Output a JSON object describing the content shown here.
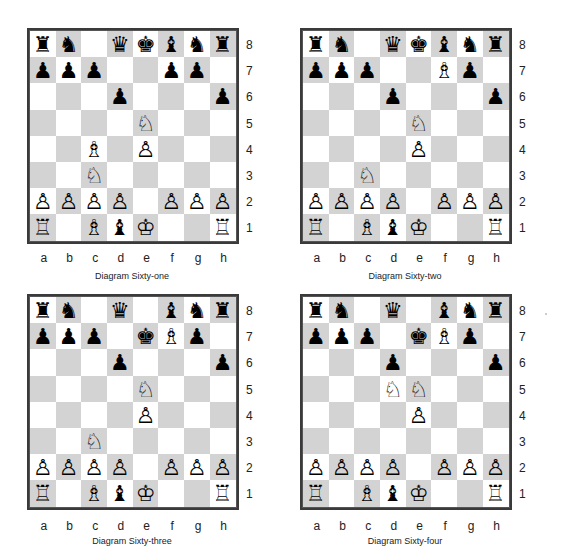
{
  "files": [
    "a",
    "b",
    "c",
    "d",
    "e",
    "f",
    "g",
    "h"
  ],
  "ranks": [
    "8",
    "7",
    "6",
    "5",
    "4",
    "3",
    "2",
    "1"
  ],
  "piece_glyphs": {
    "wK": "♔",
    "wQ": "♕",
    "wR": "♖",
    "wB": "♗",
    "wN": "♘",
    "wP": "♙",
    "bK": "♚",
    "bQ": "♛",
    "bR": "♜",
    "bB": "♝",
    "bN": "♞",
    "bP": "♟"
  },
  "colors": {
    "light_square": "#ffffff",
    "dark_square": "#d3d3d3",
    "border": "#3a3a3a"
  },
  "diagrams": [
    {
      "caption": "Diagram Sixty-one",
      "board": [
        [
          "bR",
          "bN",
          "",
          "bQ",
          "bK",
          "bB",
          "bN",
          "bR"
        ],
        [
          "bP",
          "bP",
          "bP",
          "",
          "",
          "bP",
          "bP",
          ""
        ],
        [
          "",
          "",
          "",
          "bP",
          "",
          "",
          "",
          "bP"
        ],
        [
          "",
          "",
          "",
          "",
          "wN",
          "",
          "",
          ""
        ],
        [
          "",
          "",
          "wB",
          "",
          "wP",
          "",
          "",
          ""
        ],
        [
          "",
          "",
          "wN",
          "",
          "",
          "",
          "",
          ""
        ],
        [
          "wP",
          "wP",
          "wP",
          "wP",
          "",
          "wP",
          "wP",
          "wP"
        ],
        [
          "wR",
          "",
          "wB",
          "bB",
          "wK",
          "",
          "",
          "wR"
        ]
      ]
    },
    {
      "caption": "Diagram Sixty-two",
      "board": [
        [
          "bR",
          "bN",
          "",
          "bQ",
          "bK",
          "bB",
          "bN",
          "bR"
        ],
        [
          "bP",
          "bP",
          "bP",
          "",
          "",
          "wB",
          "bP",
          ""
        ],
        [
          "",
          "",
          "",
          "bP",
          "",
          "",
          "",
          "bP"
        ],
        [
          "",
          "",
          "",
          "",
          "wN",
          "",
          "",
          ""
        ],
        [
          "",
          "",
          "",
          "",
          "wP",
          "",
          "",
          ""
        ],
        [
          "",
          "",
          "wN",
          "",
          "",
          "",
          "",
          ""
        ],
        [
          "wP",
          "wP",
          "wP",
          "wP",
          "",
          "wP",
          "wP",
          "wP"
        ],
        [
          "wR",
          "",
          "wB",
          "bB",
          "wK",
          "",
          "",
          "wR"
        ]
      ]
    },
    {
      "caption": "Diagram Sixty-three",
      "board": [
        [
          "bR",
          "bN",
          "",
          "bQ",
          "",
          "bB",
          "bN",
          "bR"
        ],
        [
          "bP",
          "bP",
          "bP",
          "",
          "bK",
          "wB",
          "bP",
          ""
        ],
        [
          "",
          "",
          "",
          "bP",
          "",
          "",
          "",
          "bP"
        ],
        [
          "",
          "",
          "",
          "",
          "wN",
          "",
          "",
          ""
        ],
        [
          "",
          "",
          "",
          "",
          "wP",
          "",
          "",
          ""
        ],
        [
          "",
          "",
          "wN",
          "",
          "",
          "",
          "",
          ""
        ],
        [
          "wP",
          "wP",
          "wP",
          "wP",
          "",
          "wP",
          "wP",
          "wP"
        ],
        [
          "wR",
          "",
          "wB",
          "bB",
          "wK",
          "",
          "",
          "wR"
        ]
      ]
    },
    {
      "caption": "Diagram Sixty-four",
      "board": [
        [
          "bR",
          "bN",
          "",
          "bQ",
          "",
          "bB",
          "bN",
          "bR"
        ],
        [
          "bP",
          "bP",
          "bP",
          "",
          "bK",
          "wB",
          "bP",
          ""
        ],
        [
          "",
          "",
          "",
          "bP",
          "",
          "",
          "",
          "bP"
        ],
        [
          "",
          "",
          "",
          "wN",
          "wN",
          "",
          "",
          ""
        ],
        [
          "",
          "",
          "",
          "",
          "wP",
          "",
          "",
          ""
        ],
        [
          "",
          "",
          "",
          "",
          "",
          "",
          "",
          ""
        ],
        [
          "wP",
          "wP",
          "wP",
          "wP",
          "",
          "wP",
          "wP",
          "wP"
        ],
        [
          "wR",
          "",
          "wB",
          "bB",
          "wK",
          "",
          "",
          "wR"
        ]
      ]
    }
  ]
}
